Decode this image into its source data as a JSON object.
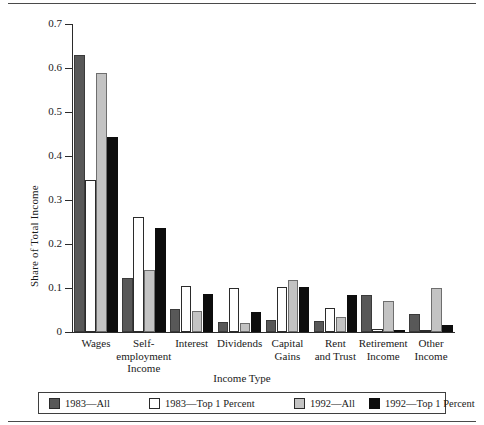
{
  "chart_data": {
    "type": "bar",
    "title": "",
    "xlabel": "Income Type",
    "ylabel": "Share of Total Income",
    "ylim": [
      0,
      0.7
    ],
    "y_ticks": [
      "0",
      "0.1",
      "0.2",
      "0.3",
      "0.4",
      "0.5",
      "0.6",
      "0.7"
    ],
    "y_tick_values": [
      0,
      0.1,
      0.2,
      0.3,
      0.4,
      0.5,
      0.6,
      0.7
    ],
    "grid": false,
    "legend_position": "bottom",
    "categories": [
      "Wages",
      "Self-employment Income",
      "Interest",
      "Dividends",
      "Capital Gains",
      "Rent and Trust",
      "Retirement Income",
      "Other Income"
    ],
    "category_lines": [
      [
        "Wages"
      ],
      [
        "Self-",
        "employment",
        "Income"
      ],
      [
        "Interest"
      ],
      [
        "Dividends"
      ],
      [
        "Capital",
        "Gains"
      ],
      [
        "Rent",
        "and Trust"
      ],
      [
        "Retirement",
        "Income"
      ],
      [
        "Other",
        "Income"
      ]
    ],
    "series": [
      {
        "name": "1983—All",
        "color": "#585858",
        "values": [
          0.63,
          0.123,
          0.052,
          0.022,
          0.028,
          0.025,
          0.085,
          0.04
        ]
      },
      {
        "name": "1983—Top 1 Percent",
        "color": "#ffffff",
        "values": [
          0.345,
          0.261,
          0.105,
          0.099,
          0.103,
          0.055,
          0.007,
          0.005
        ]
      },
      {
        "name": "1992—All",
        "color": "#c3c3c3",
        "values": [
          0.588,
          0.14,
          0.048,
          0.02,
          0.118,
          0.033,
          0.07,
          0.1
        ]
      },
      {
        "name": "1992—Top 1 Percent",
        "color": "#0d0d0d",
        "values": [
          0.443,
          0.236,
          0.086,
          0.045,
          0.102,
          0.085,
          0.004,
          0.017
        ]
      }
    ]
  },
  "legend": {
    "items": [
      {
        "label": "1983—All"
      },
      {
        "label": "1983—Top 1 Percent"
      },
      {
        "label": "1992—All"
      },
      {
        "label": "1992—Top 1 Percent"
      }
    ]
  }
}
